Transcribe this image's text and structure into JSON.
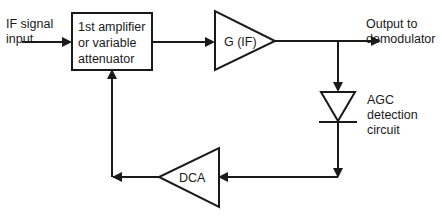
{
  "diagram": {
    "background_color": "#ffffff",
    "line_color": "#1a1a1a",
    "input": {
      "label_line1": "IF signal",
      "label_line2": "input"
    },
    "output": {
      "label_line1": "Output to",
      "label_line2": "demodulator"
    },
    "amplifier_block": {
      "line1": "1st amplifier",
      "line2": "or variable",
      "line3": "attenuator"
    },
    "gain_stage": {
      "label": "G (IF)"
    },
    "detector": {
      "icon": "diode-symbol",
      "label_line1": "AGC",
      "label_line2": "detection",
      "label_line3": "circuit"
    },
    "dc_amplifier": {
      "label": "DCA"
    }
  }
}
